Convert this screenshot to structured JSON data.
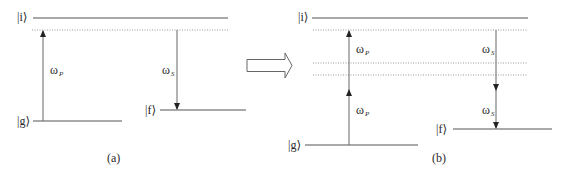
{
  "diagram": {
    "colors": {
      "line": "#555555",
      "dotted": "#888888",
      "text": "#2a2a2a",
      "background": "#ffffff"
    },
    "panel_a": {
      "caption": "(a)",
      "levels": {
        "initial": "|i⟩",
        "ground": "|g⟩",
        "final": "|f⟩"
      },
      "pump": {
        "symbol": "ω",
        "subscript": "P"
      },
      "stokes": {
        "symbol": "ω",
        "subscript": "S"
      }
    },
    "transition_arrow": {
      "label": ""
    },
    "panel_b": {
      "caption": "(b)",
      "levels": {
        "initial": "|i⟩",
        "ground": "|g⟩",
        "final": "|f⟩"
      },
      "pump_upper": {
        "symbol": "ω",
        "subscript": "P"
      },
      "pump_lower": {
        "symbol": "ω",
        "subscript": "P"
      },
      "stokes_upper": {
        "symbol": "ω",
        "subscript": "S"
      },
      "stokes_lower": {
        "symbol": "ω",
        "subscript": "S"
      }
    }
  }
}
